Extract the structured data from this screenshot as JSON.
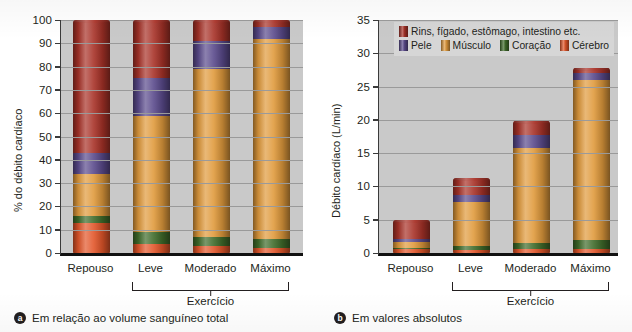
{
  "legend": {
    "items": [
      {
        "label": "Rins, fígado, estômago, intestino etc.",
        "key": "viscera",
        "color": "#A83228"
      },
      {
        "label": "Pele",
        "key": "skin",
        "color": "#5A4A8C"
      },
      {
        "label": "Músculo",
        "key": "muscle",
        "color": "#E09A3C"
      },
      {
        "label": "Coração",
        "key": "heart",
        "color": "#3F6B2A"
      },
      {
        "label": "Cérebro",
        "key": "brain",
        "color": "#E2562A"
      }
    ]
  },
  "panel_a": {
    "caption_marker": "a",
    "caption": "Em relação ao volume sanguíneo total",
    "bracket_label": "Exercício"
  },
  "panel_b": {
    "caption_marker": "b",
    "caption": "Em valores absolutos",
    "bracket_label": "Exercício"
  },
  "chart_data": [
    {
      "type": "bar",
      "stacked": true,
      "panel": "a",
      "title": "Em relação ao volume sanguíneo total",
      "xlabel": "",
      "ylabel": "% do débito cardíaco",
      "ylim": [
        0,
        100
      ],
      "yticks": [
        0,
        10,
        20,
        30,
        40,
        50,
        60,
        70,
        80,
        90,
        100
      ],
      "grid": true,
      "legend_position": "panel-b-top",
      "categories": [
        "Repouso",
        "Leve",
        "Moderado",
        "Máximo"
      ],
      "group_bracket": {
        "label": "Exercício",
        "categories": [
          "Leve",
          "Moderado",
          "Máximo"
        ]
      },
      "series": [
        {
          "name": "Cérebro",
          "key": "brain",
          "color": "#E2562A",
          "values": [
            13,
            4,
            3,
            2
          ]
        },
        {
          "name": "Coração",
          "key": "heart",
          "color": "#3F6B2A",
          "values": [
            3,
            5,
            4,
            4
          ]
        },
        {
          "name": "Músculo",
          "key": "muscle",
          "color": "#E09A3C",
          "values": [
            18,
            50,
            72,
            86
          ]
        },
        {
          "name": "Pele",
          "key": "skin",
          "color": "#5A4A8C",
          "values": [
            9,
            16,
            12,
            5
          ]
        },
        {
          "name": "Rins, fígado, estômago, intestino etc.",
          "key": "viscera",
          "color": "#A83228",
          "values": [
            57,
            25,
            9,
            3
          ]
        }
      ],
      "totals": [
        100,
        100,
        100,
        100
      ]
    },
    {
      "type": "bar",
      "stacked": true,
      "panel": "b",
      "title": "Em valores absolutos",
      "xlabel": "",
      "ylabel": "Débito cardíaco (L/min)",
      "ylim": [
        0,
        35
      ],
      "yticks": [
        0,
        5,
        10,
        15,
        20,
        25,
        30,
        35
      ],
      "grid": true,
      "legend_position": "top",
      "categories": [
        "Repouso",
        "Leve",
        "Moderado",
        "Máximo"
      ],
      "group_bracket": {
        "label": "Exercício",
        "categories": [
          "Leve",
          "Moderado",
          "Máximo"
        ]
      },
      "series": [
        {
          "name": "Cérebro",
          "key": "brain",
          "color": "#E2562A",
          "values": [
            0.65,
            0.45,
            0.6,
            0.55
          ]
        },
        {
          "name": "Coração",
          "key": "heart",
          "color": "#3F6B2A",
          "values": [
            0.15,
            0.55,
            0.9,
            1.45
          ]
        },
        {
          "name": "Músculo",
          "key": "muscle",
          "color": "#E09A3C",
          "values": [
            0.9,
            6.6,
            14.3,
            24.0
          ]
        },
        {
          "name": "Pele",
          "key": "skin",
          "color": "#5A4A8C",
          "values": [
            0.45,
            1.1,
            1.9,
            1.1
          ]
        },
        {
          "name": "Rins, fígado, estômago, intestino etc.",
          "key": "viscera",
          "color": "#A83228",
          "values": [
            2.75,
            2.5,
            2.1,
            0.7
          ]
        }
      ],
      "totals": [
        4.9,
        11.2,
        19.8,
        27.8
      ]
    }
  ]
}
